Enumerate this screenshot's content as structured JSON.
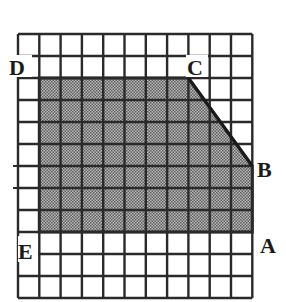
{
  "figure": {
    "type": "grid-shaded-region",
    "grid": {
      "columns": 11,
      "rows": 12,
      "origin_px": [
        18,
        34
      ],
      "cell_w_px": 21.3,
      "cell_h_px": 22,
      "line_color": "#2a2a2a"
    },
    "shaded_region": {
      "fill_light": "#bdbdbd",
      "fill_dark": "#5a5a5a",
      "vertices_grid": [
        [
          1,
          2
        ],
        [
          8,
          2
        ],
        [
          11,
          6
        ],
        [
          11,
          9
        ],
        [
          1,
          9
        ]
      ],
      "description": "Pentagon D-C-B-A-E shaded with dotted gray fill"
    },
    "labels": {
      "D": "D",
      "C": "C",
      "B": "B",
      "A": "A",
      "E": "E"
    },
    "points_grid": {
      "D": [
        1,
        2
      ],
      "C": [
        8,
        2
      ],
      "B": [
        11,
        6
      ],
      "A": [
        11,
        9
      ],
      "E": [
        1,
        9
      ]
    }
  }
}
